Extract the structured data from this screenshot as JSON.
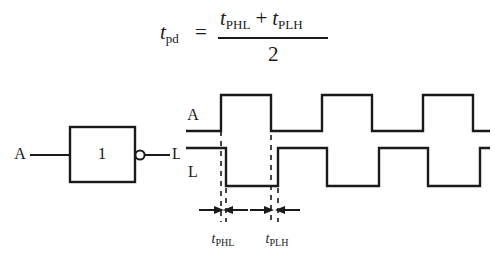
{
  "figure": {
    "background_color": "#ffffff",
    "line_color": "#1a1a1a",
    "formula": {
      "lhs_var": "t",
      "lhs_sub": "pd",
      "equals": "=",
      "numerator_term1_var": "t",
      "numerator_term1_sub": "PHL",
      "plus": "+",
      "numerator_term2_var": "t",
      "numerator_term2_sub": "PLH",
      "denominator": "2"
    },
    "gate": {
      "body_label": "1",
      "input_label": "A",
      "output_label": "L",
      "has_inverting_bubble": true
    },
    "waveforms": {
      "input_label": "A",
      "output_label": "L",
      "input_levels": [
        0,
        1,
        0,
        1,
        0,
        1,
        0
      ],
      "output_levels": [
        1,
        0,
        1,
        0,
        1,
        0,
        1
      ],
      "input_edges_x": [
        221,
        271,
        322,
        372,
        423,
        473
      ],
      "output_edges_x": [
        226,
        278,
        327,
        379,
        428,
        480
      ],
      "input_high_y": 95,
      "input_low_y": 131,
      "output_high_y": 148,
      "output_low_y": 186,
      "start_x": 186,
      "end_x": 490
    },
    "annotations": {
      "measure1_label_var": "t",
      "measure1_label_sub": "PHL",
      "measure2_label_var": "t",
      "measure2_label_sub": "PLH",
      "dashed_line_x": [
        221,
        226,
        271,
        278
      ],
      "arrow_row_y": 210
    }
  }
}
